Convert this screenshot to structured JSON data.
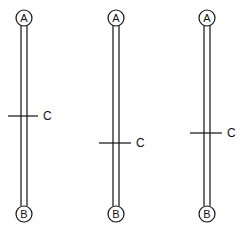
{
  "diagram": {
    "colors": {
      "stroke": "#111111",
      "background": "#ffffff"
    },
    "rods": [
      {
        "id": "rod-1",
        "x": 24,
        "top_label": "A",
        "bottom_label": "B",
        "mark_label": "C",
        "mark_y": 116,
        "mark_x1": 8,
        "mark_x2": 38
      },
      {
        "id": "rod-2",
        "x": 116,
        "top_label": "A",
        "bottom_label": "B",
        "mark_label": "C",
        "mark_y": 143,
        "mark_x1": 99,
        "mark_x2": 131
      },
      {
        "id": "rod-3",
        "x": 207,
        "top_label": "A",
        "bottom_label": "B",
        "mark_label": "C",
        "mark_y": 133,
        "mark_x1": 190,
        "mark_x2": 222
      }
    ],
    "geometry": {
      "top_circle_y": 18,
      "bottom_circle_y": 214,
      "circle_r": 8,
      "rod_half_width": 3
    }
  }
}
